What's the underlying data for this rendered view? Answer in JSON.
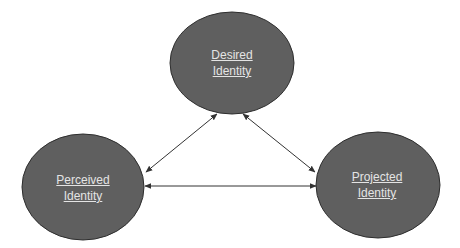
{
  "diagram": {
    "type": "triangle-relationship",
    "colors": {
      "node_fill": "#5f5f5f",
      "node_stroke": "#2e2e2e",
      "label_text": "#e4e4e4",
      "arrow": "#333333",
      "background": "#ffffff"
    },
    "nodes": [
      {
        "id": "desired",
        "line1": "Desired",
        "line2": "Identity"
      },
      {
        "id": "perceived",
        "line1": "Perceived",
        "line2": "Identity"
      },
      {
        "id": "projected",
        "line1": "Projected",
        "line2": "Identity"
      }
    ],
    "edges": [
      {
        "from": "desired",
        "to": "perceived",
        "direction": "bidirectional"
      },
      {
        "from": "desired",
        "to": "projected",
        "direction": "bidirectional"
      },
      {
        "from": "perceived",
        "to": "projected",
        "direction": "bidirectional"
      }
    ]
  }
}
